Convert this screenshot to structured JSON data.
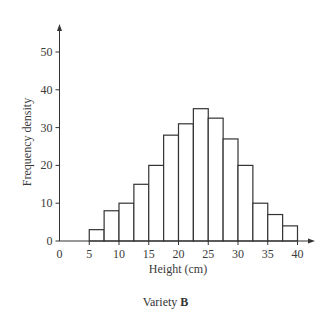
{
  "chart_data": {
    "type": "bar",
    "subtype": "histogram",
    "title": "",
    "caption_prefix": "Variety ",
    "caption_bold": "B",
    "xlabel": "Height (cm)",
    "ylabel": "Frequency density",
    "xlim": [
      0,
      40
    ],
    "ylim": [
      0,
      50
    ],
    "x_ticks": [
      0,
      5,
      10,
      15,
      20,
      25,
      30,
      35,
      40
    ],
    "y_ticks": [
      0,
      10,
      20,
      30,
      40,
      50
    ],
    "grid": false,
    "legend": null,
    "bins": [
      {
        "from": 5,
        "to": 7.5,
        "value": 3
      },
      {
        "from": 7.5,
        "to": 10,
        "value": 8
      },
      {
        "from": 10,
        "to": 12.5,
        "value": 10
      },
      {
        "from": 12.5,
        "to": 15,
        "value": 15
      },
      {
        "from": 15,
        "to": 17.5,
        "value": 20
      },
      {
        "from": 17.5,
        "to": 20,
        "value": 28
      },
      {
        "from": 20,
        "to": 22.5,
        "value": 31
      },
      {
        "from": 22.5,
        "to": 25,
        "value": 35
      },
      {
        "from": 25,
        "to": 27.5,
        "value": 32.5
      },
      {
        "from": 27.5,
        "to": 30,
        "value": 27
      },
      {
        "from": 30,
        "to": 32.5,
        "value": 20
      },
      {
        "from": 32.5,
        "to": 35,
        "value": 10
      },
      {
        "from": 35,
        "to": 37.5,
        "value": 7
      },
      {
        "from": 37.5,
        "to": 40,
        "value": 4
      }
    ],
    "categories": [
      "5-7.5",
      "7.5-10",
      "10-12.5",
      "12.5-15",
      "15-17.5",
      "17.5-20",
      "20-22.5",
      "22.5-25",
      "25-27.5",
      "27.5-30",
      "30-32.5",
      "32.5-35",
      "35-37.5",
      "37.5-40"
    ],
    "values": [
      3,
      8,
      10,
      15,
      20,
      28,
      31,
      35,
      32.5,
      27,
      20,
      10,
      7,
      4
    ]
  },
  "colors": {
    "axis": "#333333",
    "bar_stroke": "#333333",
    "bar_fill": "#ffffff",
    "text": "#3a3a3a"
  }
}
